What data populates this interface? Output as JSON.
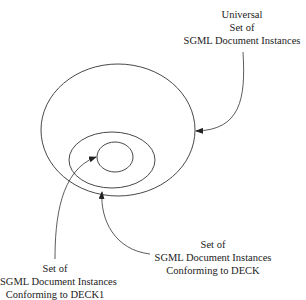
{
  "labels": {
    "universal": [
      "Universal",
      "Set of",
      "SGML Document Instances"
    ],
    "deck": [
      "Set of",
      "SGML Document Instances",
      "Conforming to DECK"
    ],
    "deck1": [
      "Set of",
      "SGML Document Instances",
      "Conforming to DECK1"
    ]
  },
  "sets": [
    {
      "name": "Universal Set of SGML Document Instances",
      "cx": 118,
      "cy": 130,
      "rx": 77,
      "ry": 66
    },
    {
      "name": "Conforming to DECK",
      "cx": 112,
      "cy": 160,
      "rx": 43,
      "ry": 28
    },
    {
      "name": "Conforming to DECK1",
      "cx": 115,
      "cy": 157,
      "rx": 18,
      "ry": 15
    }
  ],
  "colors": {
    "stroke": "#333333",
    "background": "#ffffff"
  }
}
